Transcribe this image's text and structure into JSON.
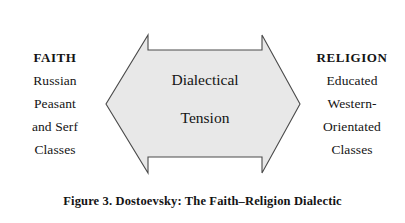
{
  "figure": {
    "caption": "Figure 3. Dostoevsky: The Faith–Religion Dialectic",
    "background_color": "#ffffff",
    "text_color": "#141414"
  },
  "left_column": {
    "name": "faith-side",
    "lines": [
      {
        "text": "FAITH",
        "emphasis": "bold"
      },
      {
        "text": "Russian",
        "emphasis": "normal"
      },
      {
        "text": "Peasant",
        "emphasis": "normal"
      },
      {
        "text": "and Serf",
        "emphasis": "normal"
      },
      {
        "text": "Classes",
        "emphasis": "normal"
      }
    ]
  },
  "right_column": {
    "name": "religion-side",
    "lines": [
      {
        "text": "RELIGION",
        "emphasis": "bold"
      },
      {
        "text": "Educated",
        "emphasis": "normal"
      },
      {
        "text": "Western-",
        "emphasis": "normal"
      },
      {
        "text": "Orientated",
        "emphasis": "normal"
      },
      {
        "text": "Classes",
        "emphasis": "normal"
      }
    ]
  },
  "arrow": {
    "name": "double-headed-arrow",
    "line1": "Dialectical",
    "line2": "Tension",
    "fill_color": "#e8e8e8",
    "stroke_color": "#4a4a4a"
  }
}
